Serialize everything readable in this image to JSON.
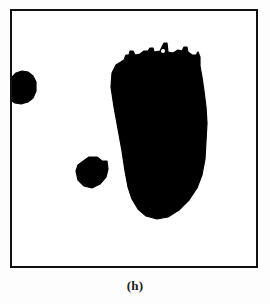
{
  "figure": {
    "caption": "(h)",
    "type": "binary-segmentation-mask",
    "frame": {
      "border_color": "#111111",
      "border_width_px": 2,
      "background_color": "#ffffff",
      "x": 10,
      "y": 9,
      "width": 248,
      "height": 259
    },
    "page_background_color": "#fdfdfd",
    "foreground_color": "#000000"
  },
  "chart_data": {
    "type": "scatter",
    "title": "(h)",
    "xlabel": "",
    "ylabel": "",
    "xlim": [
      0,
      248
    ],
    "ylim": [
      0,
      259
    ],
    "grid": false,
    "legend": "none",
    "regions": [
      {
        "name": "left-edge-blob",
        "label": "left blob",
        "centroid_x": 14,
        "centroid_y": 78,
        "width": 24,
        "height": 29,
        "clipped_by_frame": true,
        "polygon": [
          [
            0,
            66
          ],
          [
            4,
            62
          ],
          [
            10,
            60
          ],
          [
            16,
            61
          ],
          [
            21,
            65
          ],
          [
            24,
            71
          ],
          [
            24,
            80
          ],
          [
            21,
            87
          ],
          [
            16,
            91
          ],
          [
            9,
            93
          ],
          [
            3,
            92
          ],
          [
            0,
            90
          ]
        ]
      },
      {
        "name": "center-small-blob",
        "label": "center blob",
        "centroid_x": 79,
        "centroid_y": 161,
        "width": 30,
        "height": 31,
        "clipped_by_frame": false,
        "polygon": [
          [
            70,
            151
          ],
          [
            77,
            146
          ],
          [
            85,
            146
          ],
          [
            90,
            150
          ],
          [
            95,
            150
          ],
          [
            96,
            158
          ],
          [
            94,
            166
          ],
          [
            88,
            173
          ],
          [
            80,
            177
          ],
          [
            72,
            175
          ],
          [
            66,
            169
          ],
          [
            64,
            160
          ],
          [
            66,
            154
          ]
        ]
      },
      {
        "name": "large-elongated-blob",
        "label": "large blob",
        "centroid_x": 165,
        "centroid_y": 135,
        "width": 78,
        "height": 180,
        "clipped_by_frame": false,
        "polygon": [
          [
            112,
            49
          ],
          [
            114,
            44
          ],
          [
            117,
            44
          ],
          [
            118,
            40
          ],
          [
            121,
            40
          ],
          [
            123,
            44
          ],
          [
            128,
            43
          ],
          [
            132,
            40
          ],
          [
            136,
            40
          ],
          [
            138,
            37
          ],
          [
            141,
            37
          ],
          [
            142,
            41
          ],
          [
            148,
            40
          ],
          [
            152,
            32
          ],
          [
            155,
            32
          ],
          [
            156,
            41
          ],
          [
            161,
            42
          ],
          [
            166,
            39
          ],
          [
            170,
            40
          ],
          [
            172,
            36
          ],
          [
            175,
            36
          ],
          [
            176,
            41
          ],
          [
            180,
            44
          ],
          [
            184,
            44
          ],
          [
            186,
            41
          ],
          [
            188,
            46
          ],
          [
            188,
            55
          ],
          [
            190,
            66
          ],
          [
            192,
            80
          ],
          [
            194,
            96
          ],
          [
            195,
            112
          ],
          [
            194,
            130
          ],
          [
            193,
            148
          ],
          [
            190,
            164
          ],
          [
            185,
            177
          ],
          [
            177,
            189
          ],
          [
            167,
            199
          ],
          [
            156,
            206
          ],
          [
            145,
            208
          ],
          [
            134,
            205
          ],
          [
            126,
            198
          ],
          [
            120,
            188
          ],
          [
            116,
            176
          ],
          [
            113,
            160
          ],
          [
            110,
            140
          ],
          [
            106,
            118
          ],
          [
            102,
            96
          ],
          [
            99,
            76
          ],
          [
            100,
            62
          ],
          [
            104,
            54
          ]
        ],
        "holes": [
          {
            "cx": 151,
            "cy": 40,
            "r": 2
          }
        ]
      }
    ]
  }
}
